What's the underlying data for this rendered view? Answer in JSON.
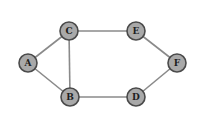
{
  "graph": {
    "nodes": [
      {
        "id": "A",
        "label": "A",
        "x": 28,
        "y": 63
      },
      {
        "id": "C",
        "label": "C",
        "x": 69,
        "y": 31
      },
      {
        "id": "B",
        "label": "B",
        "x": 70,
        "y": 97
      },
      {
        "id": "E",
        "label": "E",
        "x": 136,
        "y": 31
      },
      {
        "id": "F",
        "label": "F",
        "x": 177,
        "y": 63
      },
      {
        "id": "D",
        "label": "D",
        "x": 136,
        "y": 97
      }
    ],
    "edges": [
      {
        "from": "A",
        "to": "C"
      },
      {
        "from": "A",
        "to": "B"
      },
      {
        "from": "C",
        "to": "B"
      },
      {
        "from": "C",
        "to": "E"
      },
      {
        "from": "B",
        "to": "D"
      },
      {
        "from": "E",
        "to": "F"
      },
      {
        "from": "D",
        "to": "F"
      }
    ],
    "node_radius": 9,
    "colors": {
      "node_fill": "#a9a9a9",
      "node_stroke": "#4a4a4a",
      "edge": "#8a8a8a",
      "label": "#1e1e1e"
    }
  }
}
